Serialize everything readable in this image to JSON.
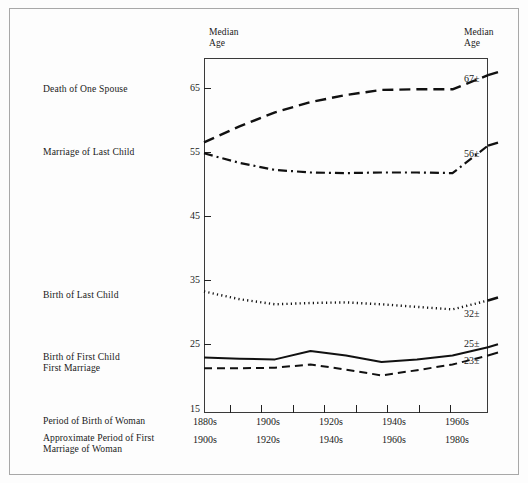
{
  "figure": {
    "axis_heading_left": "Median\nAge",
    "axis_heading_right": "Median\nAge",
    "border_color": "#a8a8a8",
    "plot_border_color": "#3a3a3a",
    "ink_color": "#1a1a1a"
  },
  "series_labels": {
    "death_of_one_spouse": "Death of One Spouse",
    "marriage_of_last_child": "Marriage of Last Child",
    "birth_of_last_child": "Birth of Last Child",
    "birth_first_child_first_marriage": "Birth of First Child\nFirst Marriage"
  },
  "end_values": {
    "death_of_one_spouse": "67±",
    "marriage_of_last_child": "56±",
    "birth_of_last_child": "32±",
    "birth_of_first_child": "25±",
    "first_marriage": "23±"
  },
  "row_captions": {
    "period_of_birth": "Period of Birth of Woman",
    "approximate_period_of_first_marriage": "Approximate Period of First\nMarriage of Woman"
  },
  "y_axis": {
    "labels": [
      "65",
      "55",
      "45",
      "35",
      "25",
      "15"
    ],
    "values": [
      65,
      55,
      45,
      35,
      25,
      15
    ]
  },
  "x_axis": {
    "birth_decades": [
      "1880s",
      "1900s",
      "1920s",
      "1940s",
      "1960s"
    ],
    "marriage_decades": [
      "1900s",
      "1920s",
      "1940s",
      "1960s",
      "1980s"
    ]
  },
  "chart_data": {
    "type": "line",
    "title": "",
    "xlabel": "Period of Birth of Woman",
    "ylabel": "Median Age",
    "ylim": [
      15,
      68
    ],
    "grid": false,
    "legend": "inline-left-margin",
    "x_tick_labels": [
      "1880s",
      "",
      "1900s",
      "",
      "1920s",
      "",
      "1940s",
      "",
      "1960s"
    ],
    "x_secondary_tick_labels": [
      "1900s",
      "",
      "1920s",
      "",
      "1940s",
      "",
      "1960s",
      "",
      "1980s"
    ],
    "x": [
      "1880s",
      "1890s",
      "1900s",
      "1910s",
      "1920s",
      "1930s",
      "1940s",
      "1950s",
      "1960s"
    ],
    "series": [
      {
        "name": "Death of One Spouse",
        "style": "dashed",
        "end_label": "67±",
        "values": [
          56.5,
          59.0,
          61.2,
          62.8,
          63.9,
          64.7,
          64.8,
          64.8,
          67.0
        ]
      },
      {
        "name": "Marriage of Last Child",
        "style": "dash-dot",
        "end_label": "56±",
        "values": [
          54.8,
          53.3,
          52.2,
          51.8,
          51.7,
          51.8,
          51.8,
          51.7,
          56.0
        ]
      },
      {
        "name": "Birth of Last Child",
        "style": "dotted",
        "end_label": "32±",
        "values": [
          33.2,
          32.0,
          31.2,
          31.4,
          31.5,
          31.2,
          30.8,
          30.4,
          31.8
        ]
      },
      {
        "name": "Birth of First Child",
        "style": "solid",
        "end_label": "25±",
        "values": [
          22.9,
          22.7,
          22.6,
          23.9,
          23.2,
          22.2,
          22.6,
          23.2,
          24.5
        ]
      },
      {
        "name": "First Marriage",
        "style": "dashed-thin",
        "end_label": "23±",
        "values": [
          21.2,
          21.2,
          21.3,
          21.8,
          21.0,
          20.1,
          20.9,
          21.8,
          23.2
        ]
      }
    ]
  }
}
